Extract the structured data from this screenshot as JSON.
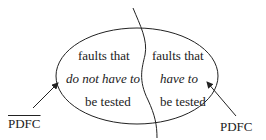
{
  "diagram": {
    "left_region": {
      "line1": "faults that",
      "line2": "do not have to",
      "line3": "be tested"
    },
    "right_region": {
      "line1": "faults that",
      "line2": "have to",
      "line3": "be tested"
    },
    "left_pointer_label": "PDFC",
    "left_pointer_label_overlined": true,
    "right_pointer_label": "PDFC",
    "stroke_color": "#222222"
  }
}
